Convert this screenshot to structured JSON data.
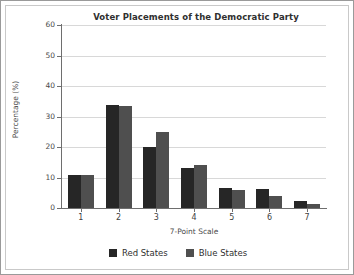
{
  "chart_data": {
    "type": "bar",
    "title": "Voter Placements of the Democratic Party",
    "xlabel": "7-Point Scale",
    "ylabel": "Percentage (%)",
    "categories": [
      "1",
      "2",
      "3",
      "4",
      "5",
      "6",
      "7"
    ],
    "series": [
      {
        "name": "Red States",
        "color": "#262626",
        "values": [
          10.8,
          33.8,
          20.0,
          13.0,
          6.5,
          6.3,
          2.3
        ]
      },
      {
        "name": "Blue States",
        "color": "#4f4f4f",
        "values": [
          10.8,
          33.5,
          25.0,
          14.2,
          5.8,
          4.0,
          1.2
        ]
      }
    ],
    "ylim": [
      0,
      60
    ],
    "yticks": [
      0,
      10,
      20,
      30,
      40,
      50,
      60
    ],
    "ytick_labels": [
      "0",
      "10",
      "20",
      "30",
      "40",
      "50",
      "60"
    ],
    "grid": true,
    "legend_position": "bottom"
  },
  "legend": {
    "items": [
      {
        "label": "Red States"
      },
      {
        "label": "Blue States"
      }
    ]
  }
}
